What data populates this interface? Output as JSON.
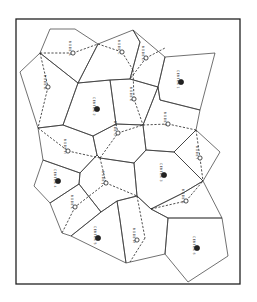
{
  "diagram": {
    "type": "thiessen-polygon-map",
    "frame": {
      "x": 16,
      "y": 19,
      "w": 224,
      "h": 265
    },
    "colors": {
      "line": "#333333",
      "background": "#ffffff",
      "marker": "#222222"
    },
    "polygons": [
      [
        [
          50,
          29
        ],
        [
          75,
          29
        ],
        [
          98,
          44
        ],
        [
          78,
          83
        ],
        [
          40,
          53
        ]
      ],
      [
        [
          98,
          44
        ],
        [
          133,
          30
        ],
        [
          140,
          42
        ],
        [
          130,
          79
        ],
        [
          110,
          80
        ],
        [
          78,
          83
        ]
      ],
      [
        [
          133,
          30
        ],
        [
          165,
          57
        ],
        [
          158,
          87
        ],
        [
          130,
          79
        ],
        [
          140,
          42
        ]
      ],
      [
        [
          165,
          57
        ],
        [
          215,
          53
        ],
        [
          200,
          110
        ],
        [
          160,
          100
        ],
        [
          158,
          87
        ]
      ],
      [
        [
          40,
          53
        ],
        [
          78,
          83
        ],
        [
          63,
          125
        ],
        [
          38,
          128
        ],
        [
          20,
          72
        ]
      ],
      [
        [
          78,
          83
        ],
        [
          110,
          80
        ],
        [
          116,
          124
        ],
        [
          93,
          136
        ],
        [
          63,
          125
        ]
      ],
      [
        [
          110,
          80
        ],
        [
          130,
          79
        ],
        [
          158,
          87
        ],
        [
          143,
          125
        ],
        [
          116,
          124
        ]
      ],
      [
        [
          158,
          87
        ],
        [
          160,
          100
        ],
        [
          200,
          110
        ],
        [
          196,
          130
        ],
        [
          174,
          152
        ],
        [
          146,
          150
        ],
        [
          143,
          125
        ]
      ],
      [
        [
          38,
          128
        ],
        [
          63,
          125
        ],
        [
          93,
          136
        ],
        [
          97,
          155
        ],
        [
          80,
          173
        ],
        [
          43,
          160
        ]
      ],
      [
        [
          93,
          136
        ],
        [
          116,
          124
        ],
        [
          143,
          125
        ],
        [
          146,
          150
        ],
        [
          134,
          163
        ],
        [
          100,
          158
        ],
        [
          97,
          155
        ]
      ],
      [
        [
          196,
          130
        ],
        [
          220,
          152
        ],
        [
          203,
          181
        ],
        [
          174,
          152
        ]
      ],
      [
        [
          43,
          160
        ],
        [
          80,
          173
        ],
        [
          79,
          184
        ],
        [
          50,
          203
        ],
        [
          34,
          186
        ]
      ],
      [
        [
          80,
          173
        ],
        [
          97,
          155
        ],
        [
          100,
          158
        ],
        [
          134,
          163
        ],
        [
          137,
          196
        ],
        [
          117,
          201
        ],
        [
          101,
          212
        ],
        [
          79,
          184
        ]
      ],
      [
        [
          134,
          163
        ],
        [
          146,
          150
        ],
        [
          174,
          152
        ],
        [
          203,
          181
        ],
        [
          183,
          193
        ],
        [
          151,
          209
        ],
        [
          137,
          196
        ]
      ],
      [
        [
          50,
          203
        ],
        [
          79,
          184
        ],
        [
          101,
          212
        ],
        [
          71,
          236
        ],
        [
          62,
          233
        ]
      ],
      [
        [
          71,
          236
        ],
        [
          101,
          212
        ],
        [
          117,
          201
        ],
        [
          120,
          220
        ],
        [
          126,
          263
        ]
      ],
      [
        [
          117,
          201
        ],
        [
          137,
          196
        ],
        [
          151,
          209
        ],
        [
          168,
          218
        ],
        [
          165,
          254
        ],
        [
          126,
          263
        ],
        [
          120,
          220
        ]
      ],
      [
        [
          151,
          209
        ],
        [
          183,
          193
        ],
        [
          203,
          181
        ],
        [
          222,
          218
        ],
        [
          168,
          218
        ]
      ],
      [
        [
          168,
          218
        ],
        [
          222,
          218
        ],
        [
          228,
          256
        ],
        [
          188,
          282
        ],
        [
          165,
          254
        ]
      ]
    ],
    "links": [
      [
        [
          40,
          53
        ],
        [
          73,
          53
        ]
      ],
      [
        [
          73,
          53
        ],
        [
          98,
          44
        ]
      ],
      [
        [
          40,
          53
        ],
        [
          48,
          87
        ]
      ],
      [
        [
          48,
          87
        ],
        [
          38,
          128
        ]
      ],
      [
        [
          98,
          44
        ],
        [
          122,
          52
        ]
      ],
      [
        [
          122,
          52
        ],
        [
          133,
          70
        ]
      ],
      [
        [
          146,
          58
        ],
        [
          130,
          79
        ]
      ],
      [
        [
          146,
          58
        ],
        [
          165,
          48
        ]
      ],
      [
        [
          133,
          70
        ],
        [
          134,
          99
        ]
      ],
      [
        [
          134,
          99
        ],
        [
          143,
          125
        ]
      ],
      [
        [
          116,
          124
        ],
        [
          118,
          133
        ]
      ],
      [
        [
          118,
          133
        ],
        [
          143,
          125
        ]
      ],
      [
        [
          143,
          125
        ],
        [
          168,
          124
        ]
      ],
      [
        [
          168,
          124
        ],
        [
          196,
          130
        ]
      ],
      [
        [
          38,
          128
        ],
        [
          68,
          151
        ]
      ],
      [
        [
          68,
          151
        ],
        [
          100,
          158
        ]
      ],
      [
        [
          100,
          158
        ],
        [
          118,
          133
        ]
      ],
      [
        [
          100,
          158
        ],
        [
          106,
          183
        ]
      ],
      [
        [
          106,
          183
        ],
        [
          137,
          196
        ]
      ],
      [
        [
          106,
          183
        ],
        [
          75,
          207
        ]
      ],
      [
        [
          75,
          207
        ],
        [
          62,
          233
        ]
      ],
      [
        [
          196,
          130
        ],
        [
          200,
          158
        ]
      ],
      [
        [
          200,
          158
        ],
        [
          203,
          181
        ]
      ],
      [
        [
          151,
          209
        ],
        [
          186,
          201
        ]
      ],
      [
        [
          186,
          201
        ],
        [
          203,
          181
        ]
      ],
      [
        [
          137,
          196
        ],
        [
          145,
          238
        ]
      ],
      [
        [
          145,
          238
        ],
        [
          130,
          262
        ]
      ]
    ],
    "nodes": [
      {
        "x": 73,
        "y": 53,
        "kind": "minor",
        "label": "NODE A"
      },
      {
        "x": 48,
        "y": 87,
        "kind": "minor",
        "label": "NODE B"
      },
      {
        "x": 122,
        "y": 52,
        "kind": "minor",
        "label": "NODE C"
      },
      {
        "x": 146,
        "y": 58,
        "kind": "minor",
        "label": "NODE D"
      },
      {
        "x": 181,
        "y": 82,
        "kind": "major",
        "label": "CENTER 1"
      },
      {
        "x": 97,
        "y": 109,
        "kind": "major",
        "label": "CENTER 2"
      },
      {
        "x": 134,
        "y": 99,
        "kind": "minor",
        "label": "NODE E"
      },
      {
        "x": 168,
        "y": 124,
        "kind": "minor",
        "label": "NODE F"
      },
      {
        "x": 118,
        "y": 133,
        "kind": "minor",
        "label": "NODE G"
      },
      {
        "x": 68,
        "y": 151,
        "kind": "minor",
        "label": "NODE H"
      },
      {
        "x": 200,
        "y": 158,
        "kind": "minor",
        "label": "NODE I"
      },
      {
        "x": 164,
        "y": 175,
        "kind": "major",
        "label": "CENTER 3"
      },
      {
        "x": 58,
        "y": 181,
        "kind": "major",
        "label": "CENTER 4"
      },
      {
        "x": 106,
        "y": 183,
        "kind": "minor",
        "label": "NODE J"
      },
      {
        "x": 186,
        "y": 201,
        "kind": "minor",
        "label": "NODE K"
      },
      {
        "x": 75,
        "y": 207,
        "kind": "minor",
        "label": "NODE L"
      },
      {
        "x": 98,
        "y": 238,
        "kind": "major",
        "label": "CENTER 5"
      },
      {
        "x": 137,
        "y": 240,
        "kind": "minor",
        "label": "NODE M"
      },
      {
        "x": 197,
        "y": 248,
        "kind": "major",
        "label": "CENTER 6"
      }
    ]
  }
}
